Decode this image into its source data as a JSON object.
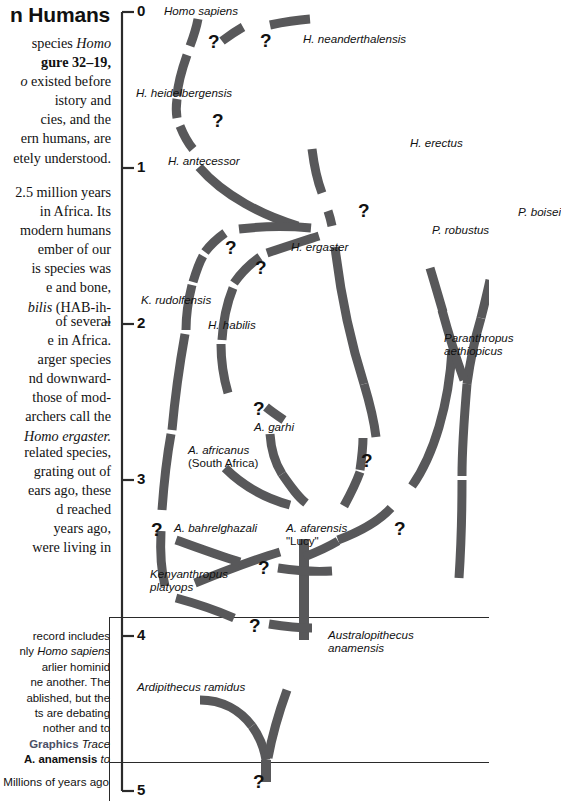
{
  "text_column": {
    "heading": "n Humans",
    "paragraph1": [
      {
        "t": "species ",
        "s": "r"
      },
      {
        "t": "Homo",
        "s": "i"
      }
    ],
    "paragraph1_lines": [
      "species <i>Homo</i>",
      "<b>gure 32–19,</b>",
      "<i>o</i> existed before",
      "istory and",
      "cies, and the",
      "ern humans, are",
      "etely understood."
    ],
    "paragraph2_lines": [
      "2.5 million years",
      "in Africa. Its",
      "modern humans",
      "ember of our",
      "is species was",
      "e and bone,",
      "<i>bilis</i> (HAB-ih-",
      "”"
    ],
    "paragraph3_lines": [
      "of several",
      "e in Africa.",
      "arger species",
      "nd downward-",
      "those of mod-",
      "archers call the",
      "<i>Homo ergaster.</i>"
    ],
    "paragraph4_lines": [
      "related species,",
      "grating out of",
      "ears ago, these",
      "d reached",
      "years ago,",
      "were living in"
    ],
    "caption_lines": [
      "record includes",
      "nly <i>Homo sapiens</i>",
      "arlier hominid",
      "ne another. The",
      "ablished, but the",
      "ts are debating",
      "nother and to",
      "<g>Graphics</g>  <i>Trace</i>",
      "<b>A. anamensis</b> <i>to</i>"
    ],
    "axis_caption": "Millions of years ago"
  },
  "chart_data": {
    "type": "diagram",
    "ylabel": "Millions of years ago",
    "axis_ticks": [
      "0",
      "1",
      "2",
      "3",
      "4",
      "5"
    ],
    "ylim": [
      0,
      5
    ],
    "axis_direction": "top-to-bottom",
    "accent_color": "#58585a",
    "taxa": [
      {
        "name": "Homo sapiens",
        "age_ma": 0.05
      },
      {
        "name": "H. neanderthalensis",
        "age_ma": 0.22
      },
      {
        "name": "H. heidelbergensis",
        "age_ma": 0.58
      },
      {
        "name": "H. antecessor",
        "age_ma": 0.98
      },
      {
        "name": "H. erectus",
        "age_ma": 1.25
      },
      {
        "name": "H. ergaster",
        "age_ma": 1.65
      },
      {
        "name": "P. robustus",
        "age_ma": 1.45
      },
      {
        "name": "P. boisei",
        "age_ma": 1.35
      },
      {
        "name": "Paranthropus aethiopicus",
        "age_ma": 2.15
      },
      {
        "name": "K. rudolfensis",
        "age_ma": 1.92
      },
      {
        "name": "H. habilis",
        "age_ma": 2.05
      },
      {
        "name": "A. garhi",
        "age_ma": 2.72
      },
      {
        "name": "A. africanus (South Africa)",
        "age_ma": 2.85
      },
      {
        "name": "A. bahrelghazali",
        "age_ma": 3.35
      },
      {
        "name": "A. afarensis \"Lucy\"",
        "age_ma": 3.35
      },
      {
        "name": "Kenyanthropus platyops",
        "age_ma": 3.65
      },
      {
        "name": "Australopithecus anamensis",
        "age_ma": 4.0
      },
      {
        "name": "Ardipithecus ramidus",
        "age_ma": 4.35
      }
    ],
    "uncertainty_markers": 13
  },
  "axis": {
    "ticks": [
      {
        "label": "0",
        "y": 12
      },
      {
        "label": "1",
        "y": 168
      },
      {
        "label": "2",
        "y": 324
      },
      {
        "label": "3",
        "y": 480
      },
      {
        "label": "4",
        "y": 636
      },
      {
        "label": "5",
        "y": 791
      }
    ]
  },
  "labels": [
    {
      "id": "homo-sapiens",
      "text": "Homo sapiens",
      "x": 52,
      "y": 4,
      "style": "italic"
    },
    {
      "id": "h-neanderthalensis",
      "text": "H. neanderthalensis",
      "x": 191,
      "y": 32,
      "style": "italic"
    },
    {
      "id": "h-heidelbergensis",
      "text": "H. heidelbergensis",
      "x": 24,
      "y": 86,
      "style": "italic"
    },
    {
      "id": "h-antecessor",
      "text": "H. antecessor",
      "x": 56,
      "y": 154,
      "style": "italic"
    },
    {
      "id": "h-erectus",
      "text": "H. erectus",
      "x": 298,
      "y": 136,
      "style": "italic"
    },
    {
      "id": "h-ergaster",
      "text": "H. ergaster",
      "x": 179,
      "y": 240,
      "style": "italic"
    },
    {
      "id": "p-robustus",
      "text": "P. robustus",
      "x": 320,
      "y": 223,
      "style": "italic"
    },
    {
      "id": "p-boisei",
      "text": "P. boisei",
      "x": 406,
      "y": 205,
      "style": "italic"
    },
    {
      "id": "paranthropus-aethiopicus",
      "text": "Paranthropus\naethiopicus",
      "x": 332,
      "y": 331,
      "style": "italic-2"
    },
    {
      "id": "k-rudolfensis",
      "text": "K. rudolfensis",
      "x": 29,
      "y": 293,
      "style": "italic"
    },
    {
      "id": "h-habilis",
      "text": "H. habilis",
      "x": 96,
      "y": 318,
      "style": "italic"
    },
    {
      "id": "a-garhi",
      "text": "A. garhi",
      "x": 142,
      "y": 420,
      "style": "italic"
    },
    {
      "id": "a-africanus",
      "text": "A. africanus\n(South Africa)",
      "x": 76,
      "y": 443,
      "style": "mixed-2"
    },
    {
      "id": "a-bahrelghazali",
      "text": "A. bahrelghazali",
      "x": 62,
      "y": 521,
      "style": "italic"
    },
    {
      "id": "a-afarensis",
      "text": "A. afarensis\n\"Lucy\"",
      "x": 174,
      "y": 521,
      "style": "mixed-2"
    },
    {
      "id": "kenyanthropus-platyops",
      "text": "Kenyanthropus\nplatyops",
      "x": 38,
      "y": 567,
      "style": "italic-2"
    },
    {
      "id": "australopithecus-anamensis",
      "text": "Australopithecus\nanamensis",
      "x": 216,
      "y": 628,
      "style": "italic-2"
    },
    {
      "id": "ardipithecus-ramidus",
      "text": "Ardipithecus ramidus",
      "x": 25,
      "y": 680,
      "style": "italic"
    }
  ],
  "question_marks": [
    {
      "id": "q-sapiens-heidelbergensis",
      "x": 96,
      "y": 31
    },
    {
      "id": "q-neanderthal",
      "x": 148,
      "y": 30
    },
    {
      "id": "q-heidelbergensis-antecessor",
      "x": 100,
      "y": 110
    },
    {
      "id": "q-ergaster-erectus",
      "x": 246,
      "y": 200
    },
    {
      "id": "q-ergaster-rudolfensis",
      "x": 113,
      "y": 237
    },
    {
      "id": "q-ergaster-habilis",
      "x": 143,
      "y": 257
    },
    {
      "id": "q-habilis-garhi",
      "x": 141,
      "y": 398
    },
    {
      "id": "q-afarensis-ergaster",
      "x": 249,
      "y": 450
    },
    {
      "id": "q-rudolfensis-base",
      "x": 39,
      "y": 519
    },
    {
      "id": "q-afarensis-right",
      "x": 282,
      "y": 518
    },
    {
      "id": "q-kenyanthropus-top",
      "x": 146,
      "y": 557
    },
    {
      "id": "q-kenyanthropus-anamensis",
      "x": 137,
      "y": 615
    },
    {
      "id": "q-root",
      "x": 141,
      "y": 771
    }
  ]
}
